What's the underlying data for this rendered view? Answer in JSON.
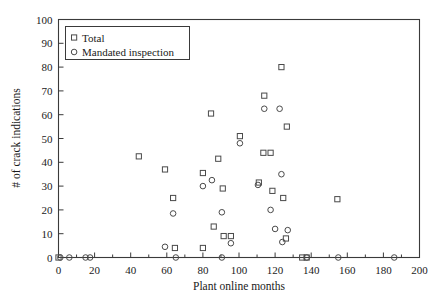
{
  "chart_data": {
    "type": "scatter",
    "title": "",
    "xlabel": "Plant online months",
    "ylabel": "# of crack indications",
    "xlim": [
      0,
      200
    ],
    "ylim": [
      0,
      100
    ],
    "xticks": [
      0,
      20,
      40,
      60,
      80,
      100,
      120,
      140,
      160,
      180,
      200
    ],
    "yticks": [
      0,
      10,
      20,
      30,
      40,
      50,
      60,
      70,
      80,
      90,
      100
    ],
    "xtick_labels": [
      "0",
      "20",
      "40",
      "60",
      "80",
      "100",
      "120",
      "140",
      "160",
      "180",
      "200"
    ],
    "ytick_labels": [
      "0",
      "10",
      "20",
      "30",
      "40",
      "50",
      "60",
      "70",
      "80",
      "90",
      "100"
    ],
    "minor_xticks": [
      10,
      30,
      50,
      70,
      90,
      110,
      130,
      150,
      170,
      190
    ],
    "grid": false,
    "legend_position": "upper-left",
    "legend": [
      {
        "label": "Total",
        "marker": "square"
      },
      {
        "label": "Mandated inspection",
        "marker": "circle"
      }
    ],
    "series": [
      {
        "name": "Total",
        "marker": "square",
        "points": [
          [
            0,
            0
          ],
          [
            44.5,
            42.5
          ],
          [
            59,
            37
          ],
          [
            63.5,
            25
          ],
          [
            64.5,
            4
          ],
          [
            80,
            4
          ],
          [
            84.5,
            60.5
          ],
          [
            80,
            35.5
          ],
          [
            88.5,
            41.5
          ],
          [
            91,
            29
          ],
          [
            86,
            13
          ],
          [
            91.5,
            9
          ],
          [
            95.5,
            9
          ],
          [
            100.5,
            51
          ],
          [
            111,
            31.5
          ],
          [
            114,
            68
          ],
          [
            113.5,
            44
          ],
          [
            117.5,
            44
          ],
          [
            123.5,
            80
          ],
          [
            126.5,
            55
          ],
          [
            118.5,
            28
          ],
          [
            124.5,
            25
          ],
          [
            126,
            8
          ],
          [
            135,
            0
          ],
          [
            137.5,
            0
          ],
          [
            154.5,
            24.5
          ]
        ]
      },
      {
        "name": "Mandated inspection",
        "marker": "circle",
        "points": [
          [
            1,
            0
          ],
          [
            6,
            0
          ],
          [
            15,
            0
          ],
          [
            17.5,
            0
          ],
          [
            59,
            4.5
          ],
          [
            63.5,
            18.5
          ],
          [
            65,
            0
          ],
          [
            80,
            30
          ],
          [
            85,
            32.5
          ],
          [
            90.5,
            0
          ],
          [
            90.5,
            19
          ],
          [
            95.5,
            6
          ],
          [
            100.5,
            48
          ],
          [
            110.5,
            30.5
          ],
          [
            114,
            62.5
          ],
          [
            117.5,
            20
          ],
          [
            122.5,
            62.5
          ],
          [
            123.5,
            35
          ],
          [
            120,
            12
          ],
          [
            127,
            11.5
          ],
          [
            124,
            6.5
          ],
          [
            137.5,
            0
          ],
          [
            155,
            0
          ],
          [
            186,
            0
          ]
        ]
      }
    ]
  }
}
